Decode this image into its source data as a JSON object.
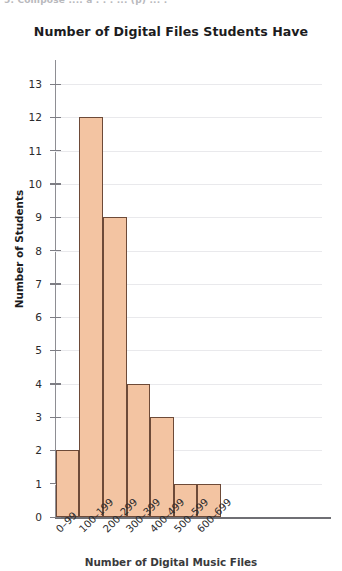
{
  "scan": {
    "top_clipped_text": "5. Compose .... a . . . ... (p) ... ."
  },
  "chart_data": {
    "type": "bar",
    "title": "Number of Digital Files Students Have",
    "xlabel": "Number of Digital Music Files",
    "ylabel": "Number of Students",
    "categories": [
      "0–99",
      "100–199",
      "200–299",
      "300–399",
      "400–499",
      "500–599",
      "600–699"
    ],
    "values": [
      2,
      12,
      9,
      4,
      3,
      1,
      1
    ],
    "ylim": [
      0,
      13
    ],
    "ytick_labels": [
      "0",
      "1",
      "2",
      "3",
      "4",
      "5",
      "6",
      "7",
      "8",
      "9",
      "10",
      "11",
      "12",
      "13"
    ],
    "ytick_values": [
      0,
      1,
      2,
      3,
      4,
      5,
      6,
      7,
      8,
      9,
      10,
      11,
      12,
      13
    ],
    "grid": true,
    "grid_axis": "y",
    "legend": null,
    "legend_position": "none",
    "bar_fill_color": "#F3C4A2",
    "bar_edge_color": "#6D4A38",
    "grid_color": "#E9E9EC",
    "axis_color": "#7E7E84",
    "text_color": "#2B2B2D",
    "background_color": "#FFFFFF",
    "xtick_label_rotation": -45
  }
}
